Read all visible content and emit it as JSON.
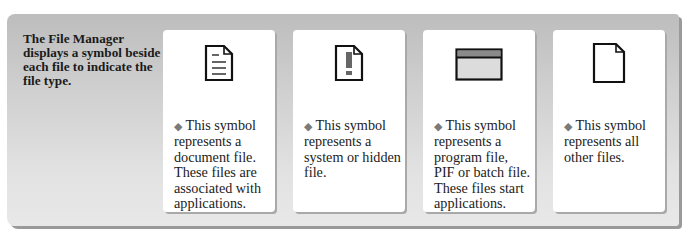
{
  "intro": "The File Manager displays a symbol beside each file to indicate the file type.",
  "bullet": "◆",
  "cards": [
    {
      "icon": "document-file-icon",
      "text": "This symbol represents a document file. These files are associated with applications."
    },
    {
      "icon": "system-hidden-file-icon",
      "text": "This symbol represents a system or hidden file."
    },
    {
      "icon": "program-file-icon",
      "text": "This symbol represents a program file, PIF or batch file. These files start applications."
    },
    {
      "icon": "other-file-icon",
      "text": "This symbol represents all other files."
    }
  ],
  "colors": {
    "panel": "#cfcfcf",
    "card": "#ffffff",
    "bullet": "#7a7a7a",
    "icon_stroke": "#111111"
  }
}
